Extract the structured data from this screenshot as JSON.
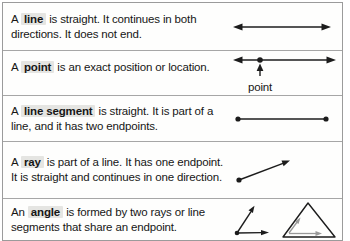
{
  "rows": [
    {
      "pre": "A",
      "term": "line",
      "post": "is straight. It continues in both directions. It does not end.",
      "diagram": "double-arrow-line"
    },
    {
      "pre": "A",
      "term": "point",
      "post": "is an exact position or location.",
      "diagram": "line-with-marked-point",
      "diagram_label": "point"
    },
    {
      "pre": "A",
      "term": "line segment",
      "post": "is straight. It is part of a line, and it has two endpoints.",
      "diagram": "segment-with-endpoints"
    },
    {
      "pre": "A",
      "term": "ray",
      "post": "is part of a line. It has one endpoint. It is straight and continues in one direction.",
      "diagram": "ray-with-endpoint-and-arrow"
    },
    {
      "pre": "An",
      "term": "angle",
      "post": "is formed by two rays or line segments that share an endpoint.",
      "diagram": "two-rays-angle-and-triangle"
    }
  ],
  "colors": {
    "ink": "#1c1c1c",
    "term_highlight": "#e5e5e2",
    "divider": "#a6a6a6",
    "border": "#9b9b9b",
    "triangle_interior_arrows": "#999999",
    "background": "#fefefd"
  }
}
